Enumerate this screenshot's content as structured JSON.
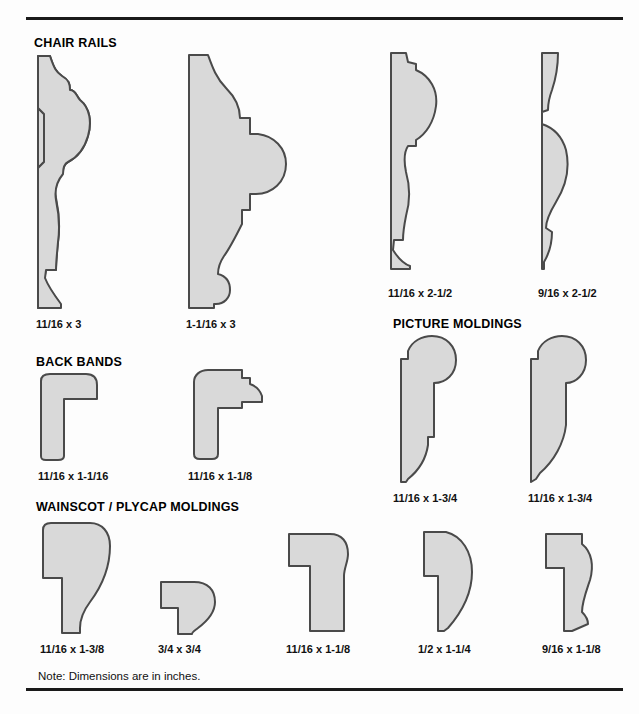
{
  "document": {
    "note": "Note: Dimensions are in inches.",
    "fill_color": "#d9d9d9",
    "outline_color": "#4a4a4a",
    "background_color": "#fdfdfd",
    "rule_color": "#1a1a1a"
  },
  "sections": [
    {
      "id": "chair-rails",
      "title": "CHAIR RAILS",
      "items": [
        {
          "id": "chair-rail-1",
          "dimension": "11/16 x 3"
        },
        {
          "id": "chair-rail-2",
          "dimension": "1-1/16 x 3"
        },
        {
          "id": "chair-rail-3",
          "dimension": "11/16 x 2-1/2"
        },
        {
          "id": "chair-rail-4",
          "dimension": "9/16 x 2-1/2"
        }
      ]
    },
    {
      "id": "back-bands",
      "title": "BACK BANDS",
      "items": [
        {
          "id": "back-band-1",
          "dimension": "11/16 x 1-1/16"
        },
        {
          "id": "back-band-2",
          "dimension": "11/16 x 1-1/8"
        }
      ]
    },
    {
      "id": "picture-moldings",
      "title": "PICTURE MOLDINGS",
      "items": [
        {
          "id": "picture-molding-1",
          "dimension": "11/16 x 1-3/4"
        },
        {
          "id": "picture-molding-2",
          "dimension": "11/16 x 1-3/4"
        }
      ]
    },
    {
      "id": "wainscot-plycap-moldings",
      "title": "WAINSCOT / PLYCAP MOLDINGS",
      "items": [
        {
          "id": "wainscot-1",
          "dimension": "11/16 x 1-3/8"
        },
        {
          "id": "wainscot-2",
          "dimension": "3/4 x 3/4"
        },
        {
          "id": "wainscot-3",
          "dimension": "11/16 x 1-1/8"
        },
        {
          "id": "wainscot-4",
          "dimension": "1/2 x 1-1/4"
        },
        {
          "id": "wainscot-5",
          "dimension": "9/16 x 1-1/8"
        }
      ]
    }
  ]
}
